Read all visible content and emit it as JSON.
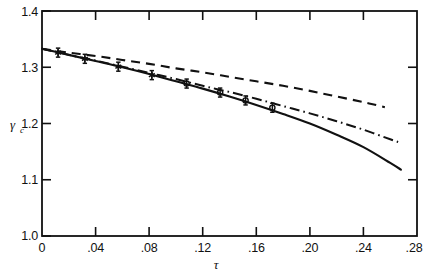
{
  "chart_data": {
    "type": "line",
    "title": "",
    "subtitle": "",
    "xlabel": "τ",
    "ylabel": "γ",
    "ylabel_subscript": "c",
    "xlim": [
      0,
      0.28
    ],
    "ylim": [
      1.0,
      1.4
    ],
    "grid": false,
    "legend_position": "none",
    "xticks": [
      0,
      0.04,
      0.08,
      0.12,
      0.16,
      0.2,
      0.24,
      0.28
    ],
    "xtick_labels": [
      "0",
      ".04",
      ".08",
      ".12",
      ".16",
      ".20",
      ".24",
      ".28"
    ],
    "yticks": [
      1.0,
      1.1,
      1.2,
      1.3,
      1.4
    ],
    "ytick_labels": [
      "1.0",
      "1.1",
      "1.2",
      "1.3",
      "1.4"
    ],
    "series": [
      {
        "name": "solid-curve",
        "style": "solid",
        "x": [
          0.0,
          0.02,
          0.04,
          0.06,
          0.08,
          0.1,
          0.12,
          0.14,
          0.16,
          0.18,
          0.2,
          0.22,
          0.24,
          0.26,
          0.268
        ],
        "values": [
          1.333,
          1.322,
          1.311,
          1.3,
          1.288,
          1.275,
          1.262,
          1.248,
          1.233,
          1.217,
          1.2,
          1.18,
          1.158,
          1.13,
          1.118
        ]
      },
      {
        "name": "dashed-curve",
        "style": "dashed",
        "x": [
          0.0,
          0.02,
          0.04,
          0.06,
          0.08,
          0.1,
          0.12,
          0.14,
          0.16,
          0.18,
          0.2,
          0.22,
          0.24,
          0.256
        ],
        "values": [
          1.333,
          1.326,
          1.32,
          1.313,
          1.306,
          1.298,
          1.291,
          1.283,
          1.275,
          1.267,
          1.258,
          1.248,
          1.238,
          1.229
        ]
      },
      {
        "name": "dash-dot-curve",
        "style": "dashdot",
        "x": [
          0.0,
          0.02,
          0.04,
          0.06,
          0.08,
          0.1,
          0.12,
          0.14,
          0.16,
          0.18,
          0.2,
          0.22,
          0.24,
          0.26,
          0.266
        ],
        "values": [
          1.333,
          1.322,
          1.312,
          1.301,
          1.29,
          1.279,
          1.267,
          1.256,
          1.244,
          1.231,
          1.218,
          1.204,
          1.189,
          1.172,
          1.167
        ]
      }
    ],
    "data_points": [
      {
        "x": 0.012,
        "y": 1.326,
        "marker": "star",
        "yerr": 0.008
      },
      {
        "x": 0.032,
        "y": 1.315,
        "marker": "star",
        "yerr": 0.008
      },
      {
        "x": 0.057,
        "y": 1.301,
        "marker": "star",
        "yerr": 0.008
      },
      {
        "x": 0.082,
        "y": 1.286,
        "marker": "star",
        "yerr": 0.008
      },
      {
        "x": 0.108,
        "y": 1.271,
        "marker": "circle",
        "yerr": 0.008
      },
      {
        "x": 0.133,
        "y": 1.255,
        "marker": "circle",
        "yerr": 0.008
      },
      {
        "x": 0.152,
        "y": 1.241,
        "marker": "circle",
        "yerr": 0.008
      },
      {
        "x": 0.172,
        "y": 1.228,
        "marker": "circle",
        "yerr": 0.008
      }
    ]
  }
}
